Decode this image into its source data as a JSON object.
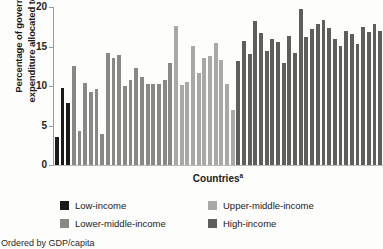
{
  "chart_data": {
    "type": "bar",
    "title": "",
    "xlabel": "Countries",
    "xlabel_superscript": "a",
    "ylabel_line1": "Percentage of government",
    "ylabel_line2": "expenditure allocated to health",
    "ylim": [
      0,
      20
    ],
    "yticks": [
      0,
      5,
      10,
      15,
      20
    ],
    "grid": false,
    "legend_position": "below-plot",
    "footnote": "Ordered by GDP/capita",
    "categories": [
      "C1",
      "C2",
      "C3",
      "C4",
      "C5",
      "C6",
      "C7",
      "C8",
      "C9",
      "C10",
      "C11",
      "C12",
      "C13",
      "C14",
      "C15",
      "C16",
      "C17",
      "C18",
      "C19",
      "C20",
      "C21",
      "C22",
      "C23",
      "C24",
      "C25",
      "C26",
      "C27",
      "C28",
      "C29",
      "C30",
      "C31",
      "C32",
      "C33",
      "C34",
      "C35",
      "C36",
      "C37",
      "C38",
      "C39",
      "C40",
      "C41",
      "C42",
      "C43",
      "C44",
      "C45",
      "C46",
      "C47",
      "C48",
      "C49",
      "C50",
      "C51",
      "C52",
      "C53",
      "C54",
      "C55",
      "C56",
      "C57",
      "C58"
    ],
    "values": [
      3.6,
      9.8,
      7.9,
      12.5,
      4.3,
      10.4,
      9.3,
      9.6,
      3.9,
      14.2,
      13.6,
      13.9,
      10.0,
      10.7,
      12.3,
      11.2,
      10.3,
      10.2,
      10.3,
      10.8,
      12.9,
      17.6,
      10.1,
      10.5,
      15.1,
      11.6,
      13.6,
      13.8,
      15.4,
      13.3,
      10.2,
      7.0,
      13.2,
      15.7,
      14.0,
      18.2,
      16.7,
      14.4,
      15.9,
      15.6,
      12.9,
      16.3,
      14.2,
      19.8,
      16.2,
      17.2,
      17.8,
      18.3,
      17.3,
      16.0,
      15.1,
      17.0,
      16.6,
      15.3,
      17.5,
      16.9,
      17.8,
      17.0
    ],
    "group_by_index": [
      "low",
      "low",
      "low",
      "lower-middle",
      "lower-middle",
      "lower-middle",
      "lower-middle",
      "lower-middle",
      "lower-middle",
      "lower-middle",
      "lower-middle",
      "lower-middle",
      "lower-middle",
      "lower-middle",
      "lower-middle",
      "lower-middle",
      "lower-middle",
      "lower-middle",
      "lower-middle",
      "lower-middle",
      "lower-middle",
      "upper-middle",
      "upper-middle",
      "upper-middle",
      "upper-middle",
      "upper-middle",
      "upper-middle",
      "upper-middle",
      "upper-middle",
      "upper-middle",
      "upper-middle",
      "upper-middle",
      "high",
      "high",
      "high",
      "high",
      "high",
      "high",
      "high",
      "high",
      "high",
      "high",
      "high",
      "high",
      "high",
      "high",
      "high",
      "high",
      "high",
      "high",
      "high",
      "high",
      "high",
      "high",
      "high",
      "high",
      "high",
      "high"
    ],
    "series_legend": [
      {
        "key": "low",
        "label": "Low-income",
        "color": "#1a1a1a"
      },
      {
        "key": "lower-middle",
        "label": "Lower-middle-income",
        "color": "#888884"
      },
      {
        "key": "upper-middle",
        "label": "Upper-middle-income",
        "color": "#a8a8a4"
      },
      {
        "key": "high",
        "label": "High-income",
        "color": "#5e5e5c"
      }
    ]
  },
  "axis": {
    "y_title_line1": "Percentage of government",
    "y_title_line2": "expenditure allocated to health",
    "x_title": "Countries",
    "x_title_sup": "a"
  },
  "legend": {
    "items": [
      {
        "label": "Low-income",
        "color": "#1a1a1a"
      },
      {
        "label": "Lower-middle-income",
        "color": "#888884"
      },
      {
        "label": "Upper-middle-income",
        "color": "#a8a8a4"
      },
      {
        "label": "High-income",
        "color": "#5e5e5c"
      }
    ]
  },
  "footnote": {
    "text": "Ordered by GDP/capita"
  }
}
